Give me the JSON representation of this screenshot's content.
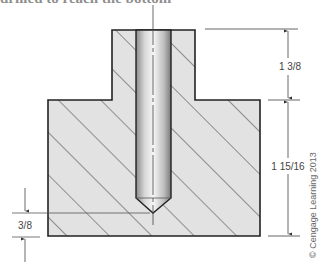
{
  "header": {
    "clipped_text": "drilled to reach the bottom"
  },
  "diagram": {
    "dimensions": {
      "boss_height": "1 3/8",
      "total_base_height": "1 15/16",
      "bottom_clearance": "3/8"
    },
    "copyright": "© Cengage Learning 2013",
    "colors": {
      "hatch_fill": "#e2e2e2",
      "outline": "#222222",
      "drill_light": "#f4f4f4",
      "drill_dark": "#8a8a8a"
    }
  }
}
